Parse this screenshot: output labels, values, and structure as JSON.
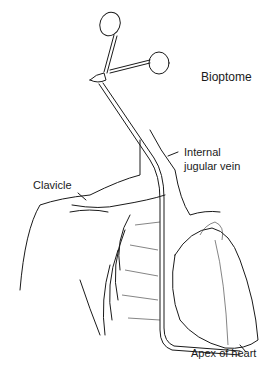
{
  "figure": {
    "labels": {
      "bioptome": "Bioptome",
      "internal_jugular_line1": "Internal",
      "internal_jugular_line2": "jugular vein",
      "clavicle": "Clavicle",
      "apex": "Apex of heart"
    }
  }
}
